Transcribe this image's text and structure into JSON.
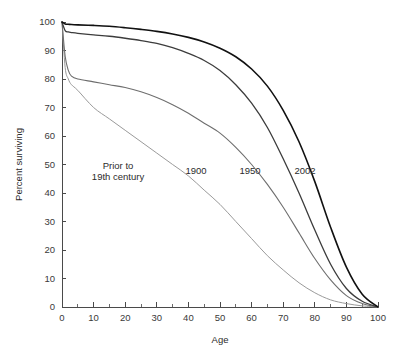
{
  "chart_data": {
    "type": "line",
    "title": "",
    "subtitle": "",
    "xlabel": "Age",
    "ylabel": "Percent surviving",
    "xlim": [
      0,
      100
    ],
    "ylim": [
      0,
      100
    ],
    "x_ticks": [
      0,
      10,
      20,
      30,
      40,
      50,
      60,
      70,
      80,
      90,
      100
    ],
    "x_tick_labels": [
      "0",
      "10",
      "20",
      "30",
      "40",
      "50",
      "60",
      "70",
      "80",
      "90",
      "100"
    ],
    "x_minor_step": 5,
    "y_ticks": [
      0,
      10,
      20,
      30,
      40,
      50,
      60,
      70,
      80,
      90,
      100
    ],
    "y_tick_labels": [
      "0",
      "10",
      "20",
      "30",
      "40",
      "50",
      "60",
      "70",
      "80",
      "90",
      "100"
    ],
    "grid": false,
    "legend": "inline-annotations",
    "series": [
      {
        "name": "Prior to 19th century",
        "label": "Prior to\n19th century",
        "color": "#9a9a9a",
        "stroke_width": 1.0,
        "x": [
          0,
          1,
          2,
          3,
          5,
          10,
          15,
          20,
          25,
          30,
          35,
          40,
          45,
          50,
          55,
          60,
          65,
          70,
          75,
          80,
          85,
          90,
          95,
          100
        ],
        "y": [
          100,
          84,
          80,
          78,
          76,
          70,
          66,
          62,
          58,
          54,
          50,
          46,
          41,
          36,
          30,
          24,
          18,
          13,
          8.5,
          5,
          2.5,
          1.2,
          0.4,
          0
        ]
      },
      {
        "name": "1900",
        "label": "1900",
        "color": "#6e6e6e",
        "stroke_width": 1.1,
        "x": [
          0,
          1,
          2,
          3,
          5,
          10,
          15,
          20,
          25,
          30,
          35,
          40,
          45,
          50,
          55,
          60,
          65,
          70,
          75,
          80,
          85,
          90,
          95,
          100
        ],
        "y": [
          100,
          88,
          83,
          81,
          80,
          79,
          78,
          77,
          75.5,
          73.5,
          71,
          68,
          64.5,
          61,
          56,
          50,
          43,
          35,
          26,
          17,
          9.5,
          4,
          1.2,
          0
        ]
      },
      {
        "name": "1950",
        "label": "1950",
        "color": "#3c3c3c",
        "stroke_width": 1.3,
        "x": [
          0,
          1,
          2,
          3,
          5,
          10,
          15,
          20,
          25,
          30,
          35,
          40,
          45,
          50,
          55,
          60,
          65,
          70,
          75,
          80,
          85,
          90,
          95,
          100
        ],
        "y": [
          100,
          97,
          96.5,
          96.3,
          96,
          95.5,
          95,
          94.3,
          93.5,
          92.5,
          91,
          89,
          86.5,
          83,
          78,
          71.5,
          63,
          52,
          40,
          27,
          15,
          6.5,
          2,
          0
        ]
      },
      {
        "name": "2002",
        "label": "2002",
        "color": "#111111",
        "stroke_width": 1.6,
        "x": [
          0,
          1,
          2,
          3,
          5,
          10,
          15,
          20,
          25,
          30,
          35,
          40,
          45,
          50,
          55,
          60,
          65,
          70,
          75,
          80,
          85,
          90,
          95,
          100
        ],
        "y": [
          100,
          99.3,
          99.2,
          99.1,
          99,
          98.8,
          98.5,
          98,
          97.4,
          96.7,
          95.8,
          94.6,
          93,
          90.8,
          87.8,
          83.5,
          77.5,
          69,
          58,
          44,
          28,
          14,
          4.5,
          0
        ]
      }
    ],
    "annotations": [
      {
        "name": "prior-to-19th-century",
        "text_line_1": "Prior to",
        "text_line_2": "19th century",
        "x_px": 118,
        "y_px": 169
      },
      {
        "name": "1900",
        "text_line_1": "1900",
        "text_line_2": "",
        "x_px": 196,
        "y_px": 174
      },
      {
        "name": "1950",
        "text_line_1": "1950",
        "text_line_2": "",
        "x_px": 250,
        "y_px": 174
      },
      {
        "name": "2002",
        "text_line_1": "2002",
        "text_line_2": "",
        "x_px": 305,
        "y_px": 174
      }
    ]
  },
  "layout": {
    "plot_left_px": 62,
    "plot_right_px": 378,
    "plot_top_px": 22,
    "plot_bottom_px": 307
  }
}
